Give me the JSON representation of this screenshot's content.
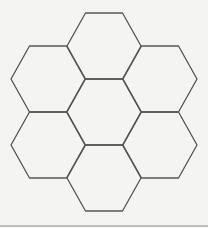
{
  "diagram": {
    "type": "hexagon-cluster",
    "stroke_color": "#555555",
    "background_color": "#f4f4f3",
    "hexagon_radius": 37,
    "hexagons": [
      {
        "id": "top",
        "cx": 104,
        "cy": 46
      },
      {
        "id": "upper-left",
        "cx": 48,
        "cy": 79
      },
      {
        "id": "upper-right",
        "cx": 160,
        "cy": 79
      },
      {
        "id": "center",
        "cx": 104,
        "cy": 112
      },
      {
        "id": "lower-left",
        "cx": 48,
        "cy": 145
      },
      {
        "id": "lower-right",
        "cx": 160,
        "cy": 145
      },
      {
        "id": "bottom",
        "cx": 104,
        "cy": 178
      }
    ],
    "baseline": {
      "y": 226,
      "x1": 0,
      "x2": 208
    }
  }
}
